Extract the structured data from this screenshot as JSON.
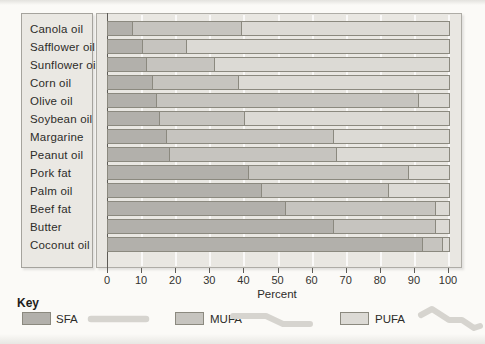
{
  "chart_data": {
    "type": "bar",
    "orientation": "horizontal",
    "stacked": true,
    "title": "",
    "xlabel": "Percent",
    "ylabel": "",
    "xlim": [
      0,
      100
    ],
    "xticks": [
      0,
      10,
      20,
      30,
      40,
      50,
      60,
      70,
      80,
      90,
      100
    ],
    "grid": true,
    "legend_position": "bottom",
    "categories": [
      "Canola oil",
      "Safflower oil",
      "Sunflower oil",
      "Corn oil",
      "Olive oil",
      "Soybean oil",
      "Margarine",
      "Peanut oil",
      "Pork fat",
      "Palm oil",
      "Beef fat",
      "Butter",
      "Coconut oil"
    ],
    "series": [
      {
        "name": "SFA",
        "color": "#b2b0ab",
        "values": [
          7,
          10,
          11,
          13,
          14,
          15,
          17,
          18,
          41,
          45,
          52,
          66,
          92
        ]
      },
      {
        "name": "MUFA",
        "color": "#c6c4bf",
        "values": [
          32,
          13,
          20,
          25,
          77,
          25,
          49,
          49,
          47,
          37,
          44,
          30,
          6
        ]
      },
      {
        "name": "PUFA",
        "color": "#dcdad5",
        "values": [
          61,
          77,
          69,
          62,
          9,
          60,
          34,
          33,
          12,
          18,
          4,
          4,
          2
        ]
      }
    ]
  },
  "key": {
    "title": "Key",
    "items": [
      {
        "label": "SFA",
        "color": "#b2b0ab",
        "icon": "straight-chain"
      },
      {
        "label": "MUFA",
        "color": "#c6c4bf",
        "icon": "single-bend-chain"
      },
      {
        "label": "PUFA",
        "color": "#dcdad5",
        "icon": "double-bend-chain"
      }
    ]
  },
  "colors": {
    "page_background": "#fbfaf7",
    "plot_background": "#e9e7e2",
    "label_panel_background": "#eae8e3",
    "bar_border": "#8b897f",
    "axis": "#5d5b56",
    "chain_icon": "#d6d4cf"
  }
}
